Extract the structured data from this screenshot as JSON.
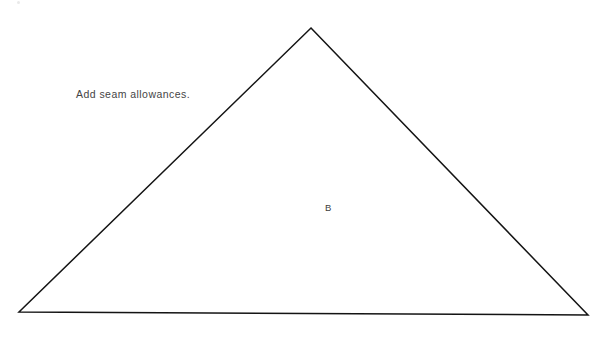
{
  "canvas": {
    "width": 610,
    "height": 338,
    "background_color": "#ffffff"
  },
  "annotations": {
    "instruction": "Add seam allowances.",
    "piece_label": "B"
  },
  "shape": {
    "name": "triangle",
    "stroke_color": "#141414",
    "stroke_width": 1.5,
    "fill": "none",
    "points": "311,28 588,315 19,312",
    "vertices": [
      {
        "name": "apex",
        "x": 311,
        "y": 28
      },
      {
        "name": "bottom-right",
        "x": 588,
        "y": 315
      },
      {
        "name": "bottom-left",
        "x": 19,
        "y": 312
      }
    ]
  }
}
